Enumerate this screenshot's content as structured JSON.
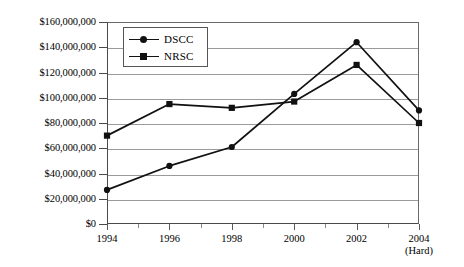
{
  "chart_data": {
    "type": "line",
    "title": "",
    "xlabel": "",
    "ylabel": "",
    "grid": true,
    "legend_position": "top-left-inside",
    "categories": [
      "1994",
      "1996",
      "1998",
      "2000",
      "2002",
      "2004"
    ],
    "x_tick_sublabels": [
      "",
      "",
      "",
      "",
      "",
      "(Hard)"
    ],
    "ylim": [
      0,
      160000000
    ],
    "y_ticks": [
      0,
      20000000,
      40000000,
      60000000,
      80000000,
      100000000,
      120000000,
      140000000,
      160000000
    ],
    "y_tick_labels": [
      "$0",
      "$20,000,000",
      "$40,000,000",
      "$60,000,000",
      "$80,000,000",
      "$100,000,000",
      "$120,000,000",
      "$140,000,000",
      "$160,000,000"
    ],
    "series": [
      {
        "name": "DSCC",
        "marker": "circle",
        "color": "#111111",
        "values": [
          27000000,
          46000000,
          61000000,
          103000000,
          144000000,
          90000000
        ]
      },
      {
        "name": "NRSC",
        "marker": "square",
        "color": "#111111",
        "values": [
          70000000,
          95000000,
          92000000,
          97000000,
          126000000,
          80000000
        ]
      }
    ]
  },
  "legend": {
    "items": [
      {
        "label": "DSCC",
        "marker": "circle"
      },
      {
        "label": "NRSC",
        "marker": "square"
      }
    ]
  },
  "colors": {
    "series_line": "#111111",
    "gridline": "#9a9a9a",
    "axis": "#4a4a4a",
    "background": "#ffffff"
  }
}
